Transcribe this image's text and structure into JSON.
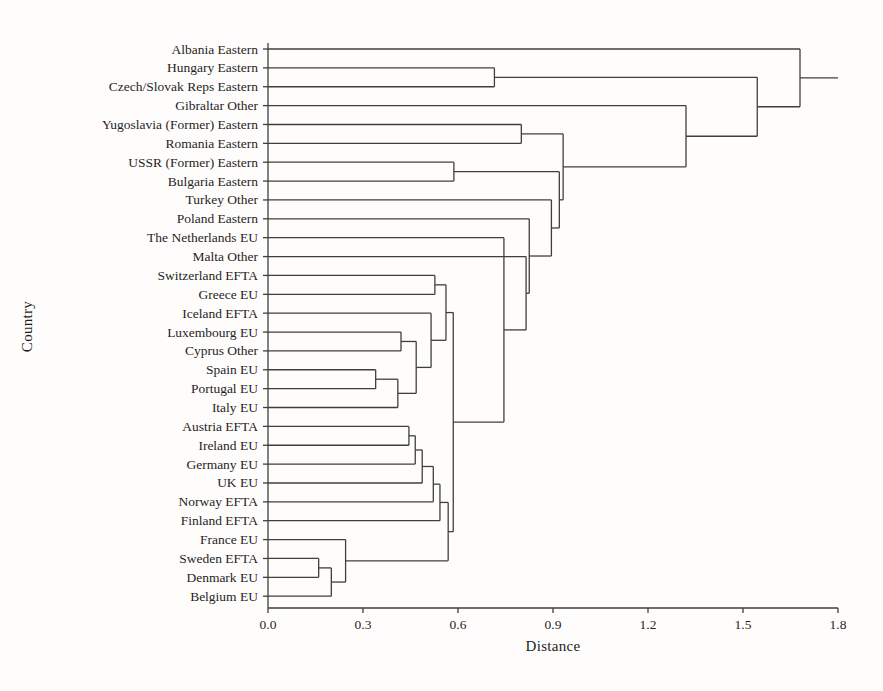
{
  "chart_data": {
    "type": "dendrogram",
    "orientation": "horizontal",
    "title": "",
    "xlabel": "Distance",
    "ylabel": "Country",
    "xlim": [
      0.0,
      1.8
    ],
    "x_ticks": [
      "0.0",
      "0.3",
      "0.6",
      "0.9",
      "1.2",
      "1.5",
      "1.8"
    ],
    "grid": "off",
    "legend": "none",
    "line_color": "#3f3f3f",
    "label_color": "#1f1f1f",
    "leaves": [
      "Albania Eastern",
      "Hungary Eastern",
      "Czech/Slovak Reps Eastern",
      "Gibraltar Other",
      "Yugoslavia (Former) Eastern",
      "Romania Eastern",
      "USSR (Former) Eastern",
      "Bulgaria Eastern",
      "Turkey Other",
      "Poland Eastern",
      "The Netherlands EU",
      "Malta Other",
      "Switzerland EFTA",
      "Greece EU",
      "Iceland EFTA",
      "Luxembourg EU",
      "Cyprus Other",
      "Spain EU",
      "Portugal EU",
      "Italy EU",
      "Austria EFTA",
      "Ireland EU",
      "Germany EU",
      "UK EU",
      "Norway EFTA",
      "Finland EFTA",
      "France EU",
      "Sweden EFTA",
      "Denmark EU",
      "Belgium EU"
    ],
    "merges": [
      {
        "a": "L27",
        "b": "L28",
        "d": 0.16
      },
      {
        "a": "M1",
        "b": "L29",
        "d": 0.2
      },
      {
        "a": "L26",
        "b": "M2",
        "d": 0.245
      },
      {
        "a": "L17",
        "b": "L18",
        "d": 0.34
      },
      {
        "a": "M4",
        "b": "L19",
        "d": 0.41
      },
      {
        "a": "L15",
        "b": "L16",
        "d": 0.42
      },
      {
        "a": "L20",
        "b": "L21",
        "d": 0.445
      },
      {
        "a": "M7",
        "b": "L22",
        "d": 0.465
      },
      {
        "a": "M6",
        "b": "M5",
        "d": 0.468
      },
      {
        "a": "M8",
        "b": "L23",
        "d": 0.487
      },
      {
        "a": "L14",
        "b": "M9",
        "d": 0.515
      },
      {
        "a": "M10",
        "b": "L24",
        "d": 0.522
      },
      {
        "a": "L12",
        "b": "L13",
        "d": 0.527
      },
      {
        "a": "M12",
        "b": "L25",
        "d": 0.543
      },
      {
        "a": "M13",
        "b": "M11",
        "d": 0.562
      },
      {
        "a": "M14",
        "b": "M3",
        "d": 0.569
      },
      {
        "a": "M15",
        "b": "M16",
        "d": 0.585
      },
      {
        "a": "L6",
        "b": "L7",
        "d": 0.587
      },
      {
        "a": "L4",
        "b": "L5",
        "d": 0.8
      },
      {
        "a": "L1",
        "b": "L2",
        "d": 0.715
      },
      {
        "a": "M17",
        "b": "L10",
        "d": 0.745
      },
      {
        "a": "M21",
        "b": "L11",
        "d": 0.815
      },
      {
        "a": "M22",
        "b": "L9",
        "d": 0.825
      },
      {
        "a": "M23",
        "b": "L8",
        "d": 0.895
      },
      {
        "a": "M24",
        "b": "M18",
        "d": 0.92
      },
      {
        "a": "M25",
        "b": "M19",
        "d": 0.932
      },
      {
        "a": "M26",
        "b": "L3",
        "d": 1.32
      },
      {
        "a": "M27",
        "b": "M20",
        "d": 1.545
      },
      {
        "a": "M28",
        "b": "L0",
        "d": 1.68
      }
    ],
    "root_tail_to": 1.8
  }
}
